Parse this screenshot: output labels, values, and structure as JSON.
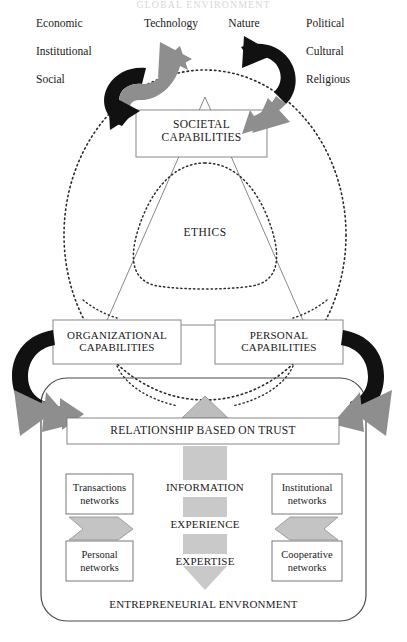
{
  "title": "GLOBAL ENVIRONMENT",
  "global_environment": {
    "left_words": [
      "Economic",
      "Institutional",
      "Social"
    ],
    "center_words": [
      "Technology",
      "Nature"
    ],
    "right_words": [
      "Political",
      "Cultural",
      "Religious"
    ]
  },
  "societal": {
    "label": "SOCIETAL\nCAPABILITIES"
  },
  "ethics": {
    "label": "ETHICS"
  },
  "capabilities": {
    "organizational": "ORGANIZATIONAL\nCAPABILITIES",
    "personal": "PERSONAL\nCAPABILITIES"
  },
  "trust": {
    "label": "RELATIONSHIP BASED ON TRUST"
  },
  "flow": {
    "items": [
      "INFORMATION",
      "EXPERIENCE",
      "EXPERTISE"
    ]
  },
  "networks": {
    "top_left": "Transactions\nnetworks",
    "bottom_left": "Personal\nnetworks",
    "top_right": "Institutional\nnetworks",
    "bottom_right": "Cooperative\nnetworks"
  },
  "entrepreneurial": {
    "label": "ENTREPRENEURIAL ENVRONMENT"
  },
  "colors": {
    "ink": "#1a1a1a",
    "line": "#6b6b6b",
    "grey_fill": "#b5b5b5",
    "grey_arrow": "#8e8e8e",
    "black_arrow": "#111111",
    "dotted": "#2a2a2a"
  }
}
